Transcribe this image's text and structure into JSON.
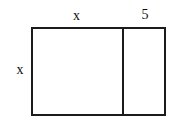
{
  "figure": {
    "type": "geometry-diagram",
    "shape": "rectangle-split-vertically",
    "background_color": "#ffffff",
    "stroke_color": "#1b1b1b",
    "stroke_width_px": 2,
    "labels": {
      "top_left_segment": "x",
      "top_right_segment": "5",
      "left_side": "x"
    }
  },
  "chart_data": {
    "type": "diagram",
    "title": "",
    "regions": [
      {
        "name": "left-region",
        "top_label": "x",
        "left_label": "x",
        "width_expression": "x",
        "height_expression": "x"
      },
      {
        "name": "right-region",
        "top_label": "5",
        "width_expression": "5",
        "height_expression": "x"
      }
    ],
    "annotations": [
      "x",
      "5",
      "x"
    ]
  }
}
